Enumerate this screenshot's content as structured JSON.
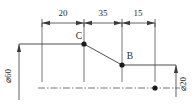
{
  "drawing": {
    "type": "engineering-dimension-sketch",
    "colors": {
      "line": "#3a3a3a",
      "text": "#2b2b2b",
      "background": "#ffffff",
      "point": "#1a1a1a"
    },
    "horizontal_dimensions": [
      {
        "label": "20",
        "x_start": 42,
        "x_end": 84
      },
      {
        "label": "35",
        "x_end": 122,
        "x_start": 84
      },
      {
        "label": "15",
        "x_start": 122,
        "x_end": 155
      }
    ],
    "vertical_dimensions": [
      {
        "label": "⌀60",
        "position": "left"
      },
      {
        "label": "⌀20",
        "position": "right"
      }
    ],
    "points": [
      {
        "label": "C",
        "x": 84,
        "y": 44
      },
      {
        "label": "B",
        "x": 122,
        "y": 65
      },
      {
        "label": "",
        "x": 155,
        "y": 88
      }
    ],
    "centerline": {
      "y": 88,
      "x_start": 38,
      "x_end": 180,
      "style": "dash-dot"
    }
  }
}
